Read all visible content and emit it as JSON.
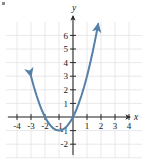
{
  "figure": {
    "kind": "coordinate-graph",
    "bullet_marker": "•",
    "axis_labels": {
      "x": "x",
      "y": "y"
    },
    "curve_color": "#5580a8",
    "axis_color": "#2b2b2b",
    "grid_color": "#e2e2e6",
    "background": "#ffffff"
  },
  "chart_data": {
    "type": "line",
    "title": "",
    "subtitle": "",
    "xlabel": "x",
    "ylabel": "y",
    "xlim": [
      -4.8,
      4.8
    ],
    "ylim": [
      -2.8,
      7.2
    ],
    "xticks": [
      -4,
      -3,
      -2,
      -1,
      1,
      2,
      3,
      4
    ],
    "yticks": [
      6,
      5,
      4,
      3,
      2,
      1,
      -1,
      -2
    ],
    "xtick_labels": [
      "-4",
      "-3",
      "-2",
      "-1",
      "1",
      "2",
      "3",
      "4"
    ],
    "ytick_labels": [
      "6",
      "5",
      "4",
      "3",
      "2",
      "1",
      "-1",
      "-2"
    ],
    "grid": true,
    "legend": null,
    "series": [
      {
        "name": "parabola",
        "equation": "y = x^2 + 2x",
        "color": "#5580a8",
        "arrows": [
          "start",
          "end"
        ],
        "vertex": [
          -1,
          -1
        ],
        "x_intercepts": [
          -2,
          0
        ],
        "points": [
          {
            "x": -3.0,
            "y": 3.0
          },
          {
            "x": -2.8,
            "y": 2.24
          },
          {
            "x": -2.6,
            "y": 1.56
          },
          {
            "x": -2.4,
            "y": 0.96
          },
          {
            "x": -2.2,
            "y": 0.44
          },
          {
            "x": -2.0,
            "y": 0.0
          },
          {
            "x": -1.8,
            "y": -0.36
          },
          {
            "x": -1.6,
            "y": -0.64
          },
          {
            "x": -1.4,
            "y": -0.84
          },
          {
            "x": -1.2,
            "y": -0.96
          },
          {
            "x": -1.0,
            "y": -1.0
          },
          {
            "x": -0.8,
            "y": -0.96
          },
          {
            "x": -0.6,
            "y": -0.84
          },
          {
            "x": -0.4,
            "y": -0.64
          },
          {
            "x": -0.2,
            "y": -0.36
          },
          {
            "x": 0.0,
            "y": 0.0
          },
          {
            "x": 0.2,
            "y": 0.44
          },
          {
            "x": 0.4,
            "y": 0.96
          },
          {
            "x": 0.6,
            "y": 1.56
          },
          {
            "x": 0.8,
            "y": 2.24
          },
          {
            "x": 1.0,
            "y": 3.0
          },
          {
            "x": 1.2,
            "y": 3.84
          },
          {
            "x": 1.4,
            "y": 4.76
          },
          {
            "x": 1.6,
            "y": 5.76
          },
          {
            "x": 1.8,
            "y": 6.84
          }
        ]
      }
    ]
  }
}
